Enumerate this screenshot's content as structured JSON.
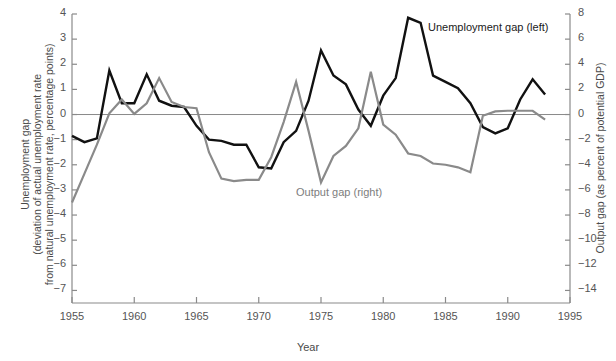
{
  "chart_data": {
    "type": "line",
    "title": "",
    "xlabel": "Year",
    "ylabel": "Unemployment gap (deviation of actual unemployment rate from natural unemployment rate, percentage points)",
    "y2label": "Output gap (as percent of potential GDP)",
    "grid": false,
    "legend_position": "inline-annotation",
    "xlim": [
      1955,
      1995
    ],
    "ylim": [
      -7.5,
      4
    ],
    "y2lim": [
      -15,
      8
    ],
    "xticks": [
      "1955",
      "1960",
      "1965",
      "1970",
      "1975",
      "1980",
      "1985",
      "1990",
      "1995"
    ],
    "xtick_values": [
      1955,
      1960,
      1965,
      1970,
      1975,
      1980,
      1985,
      1990,
      1995
    ],
    "yticks": [
      "4",
      "3",
      "2",
      "1",
      "0",
      "−1",
      "−2",
      "−3",
      "−4",
      "−5",
      "−6",
      "−7"
    ],
    "ytick_values": [
      4,
      3,
      2,
      1,
      0,
      -1,
      -2,
      -3,
      -4,
      -5,
      -6,
      -7
    ],
    "y2ticks": [
      "8",
      "6",
      "4",
      "2",
      "0",
      "−2",
      "−4",
      "−6",
      "−8",
      "−10",
      "−12",
      "−14"
    ],
    "y2tick_values": [
      8,
      6,
      4,
      2,
      0,
      -2,
      -4,
      -6,
      -8,
      -10,
      -12,
      -14
    ],
    "x": [
      1955,
      1956,
      1957,
      1958,
      1959,
      1960,
      1961,
      1962,
      1963,
      1964,
      1965,
      1966,
      1967,
      1968,
      1969,
      1970,
      1971,
      1972,
      1973,
      1974,
      1975,
      1976,
      1977,
      1978,
      1979,
      1980,
      1981,
      1982,
      1983,
      1984,
      1985,
      1986,
      1987,
      1988,
      1989,
      1990,
      1991,
      1992,
      1993
    ],
    "series": [
      {
        "name": "Unemployment gap (left)",
        "axis": "left",
        "color": "#111111",
        "units": "percentage points",
        "values": [
          -0.85,
          -1.1,
          -0.95,
          1.75,
          0.45,
          0.45,
          1.6,
          0.55,
          0.35,
          0.3,
          -0.45,
          -1.0,
          -1.05,
          -1.2,
          -1.2,
          -2.1,
          -2.15,
          -1.1,
          -0.65,
          0.55,
          2.55,
          1.55,
          1.2,
          0.2,
          -0.45,
          0.75,
          1.45,
          3.85,
          3.65,
          1.55,
          1.3,
          1.05,
          0.45,
          -0.5,
          -0.75,
          -0.55,
          0.6,
          1.4,
          0.8
        ]
      },
      {
        "name": "Output gap (right)",
        "axis": "right",
        "color": "#8a8a8a",
        "units": "percent of potential GDP",
        "values": [
          -7.0,
          -4.7,
          -2.4,
          0.1,
          1.2,
          0.05,
          0.9,
          2.9,
          1.0,
          0.6,
          0.5,
          -3.0,
          -5.1,
          -5.3,
          -5.2,
          -5.2,
          -3.4,
          -0.6,
          2.6,
          -1.3,
          -5.4,
          -3.3,
          -2.5,
          -1.1,
          3.4,
          -0.8,
          -1.6,
          -3.1,
          -3.3,
          -3.9,
          -4.0,
          -4.2,
          -4.6,
          -0.1,
          0.25,
          0.3,
          0.3,
          0.3,
          -0.4
        ]
      }
    ],
    "annotations": [
      {
        "text": "Unemployment gap (left)",
        "series": "unemployment",
        "x_px": 428,
        "y_px": 21
      },
      {
        "text": "Output gap (right)",
        "series": "output",
        "x_px": 296,
        "y_px": 186
      }
    ]
  },
  "colors": {
    "unemployment_line": "#111111",
    "output_line": "#8a8a8a",
    "axis": "#8a8a8a",
    "zero_line": "#8a8a8a",
    "text": "#555555",
    "background": "#ffffff"
  }
}
